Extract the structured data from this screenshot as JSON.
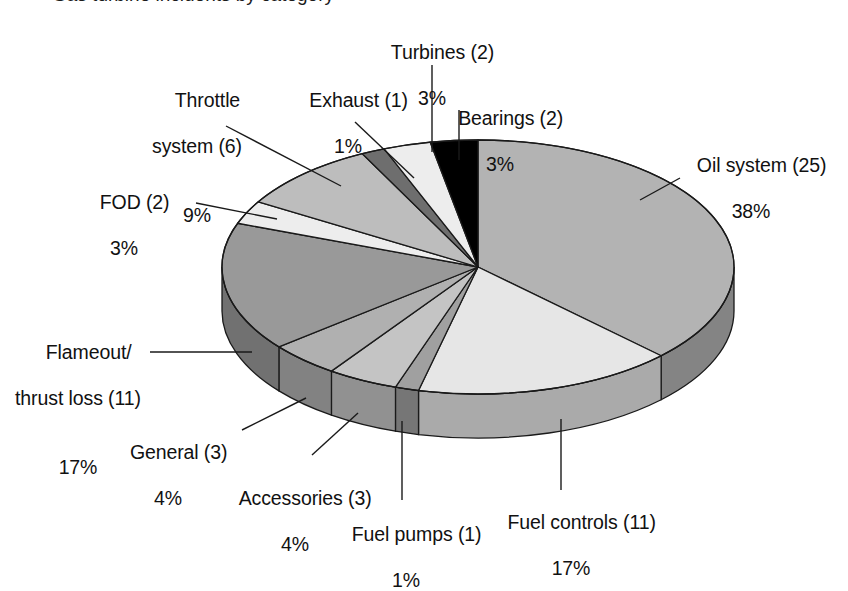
{
  "figure": {
    "title_partial": "Gas turbine incidents by category",
    "background": "#ffffff",
    "text_color": "#111111"
  },
  "chart_data": {
    "type": "pie",
    "title": "",
    "xlabel": "",
    "ylabel": "",
    "total_count": 67,
    "three_d": true,
    "legend": "none (direct callout labels with leader lines)",
    "grid": false,
    "categories": [
      "Oil system",
      "Fuel controls",
      "Fuel pumps",
      "Accessories",
      "General",
      "Flameout/thrust loss",
      "FOD",
      "Throttle system",
      "Exhaust",
      "Turbines",
      "Bearings"
    ],
    "counts": [
      25,
      11,
      1,
      3,
      3,
      11,
      2,
      6,
      1,
      2,
      2
    ],
    "values": [
      38,
      17,
      1,
      4,
      4,
      17,
      3,
      9,
      1,
      3,
      3
    ],
    "value_unit": "%",
    "slices": [
      {
        "name": "Oil system",
        "count": 25,
        "percent": 38,
        "label": "Oil system (25)",
        "pct_label": "38%",
        "color": "#b3b3b3"
      },
      {
        "name": "Fuel controls",
        "count": 11,
        "percent": 17,
        "label": "Fuel controls (11)",
        "pct_label": "17%",
        "color": "#e6e6e6"
      },
      {
        "name": "Fuel pumps",
        "count": 1,
        "percent": 1,
        "label": "Fuel pumps (1)",
        "pct_label": "1%",
        "color": "#a0a0a0"
      },
      {
        "name": "Accessories",
        "count": 3,
        "percent": 4,
        "label": "Accessories (3)",
        "pct_label": "4%",
        "color": "#c4c4c4"
      },
      {
        "name": "General",
        "count": 3,
        "percent": 4,
        "label": "General (3)",
        "pct_label": "4%",
        "color": "#b0b0b0"
      },
      {
        "name": "Flameout/thrust loss",
        "count": 11,
        "percent": 17,
        "label": "Flameout/\nthrust loss (11)",
        "pct_label": "17%",
        "color": "#999999"
      },
      {
        "name": "FOD",
        "count": 2,
        "percent": 3,
        "label": "FOD (2)",
        "pct_label": "3%",
        "color": "#ededed"
      },
      {
        "name": "Throttle system",
        "count": 6,
        "percent": 9,
        "label": "Throttle\nsystem (6)",
        "pct_label": "9%",
        "color": "#bdbdbd"
      },
      {
        "name": "Exhaust",
        "count": 1,
        "percent": 1,
        "label": "Exhaust (1)",
        "pct_label": "1%",
        "color": "#6e6e6e"
      },
      {
        "name": "Turbines",
        "count": 2,
        "percent": 3,
        "label": "Turbines (2)",
        "pct_label": "3%",
        "color": "#ededed"
      },
      {
        "name": "Bearings",
        "count": 2,
        "percent": 3,
        "label": "Bearings (2)",
        "pct_label": "3%",
        "color": "#000000"
      }
    ]
  },
  "labels": {
    "turbines": {
      "name": "Turbines (2)",
      "pct": "3%"
    },
    "throttle": {
      "name_l1": "Throttle",
      "name_l2": "system (6)",
      "pct": "9%"
    },
    "exhaust": {
      "name": "Exhaust (1)",
      "pct": "1%"
    },
    "bearings": {
      "name": "Bearings (2)",
      "pct": "3%"
    },
    "oil": {
      "name": "Oil system (25)",
      "pct": "38%"
    },
    "fod": {
      "name": "FOD (2)",
      "pct": "3%"
    },
    "flameout": {
      "name_l1": "Flameout/",
      "name_l2": "thrust loss (11)",
      "pct": "17%"
    },
    "general": {
      "name": "General (3)",
      "pct": "4%"
    },
    "accessories": {
      "name": "Accessories (3)",
      "pct": "4%"
    },
    "fuelpumps": {
      "name": "Fuel pumps (1)",
      "pct": "1%"
    },
    "fuelcontrols": {
      "name": "Fuel controls (11)",
      "pct": "17%"
    }
  }
}
